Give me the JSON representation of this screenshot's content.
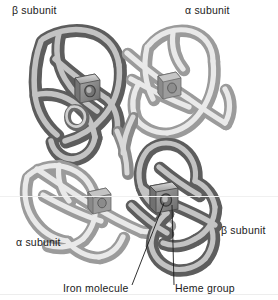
{
  "figure": {
    "background_color": "#ffffff",
    "subunit_colors": {
      "alpha": "#c9c9c9",
      "beta": "#8d8d8d",
      "heme": "#8a8a8a",
      "leader_line": "#1a1a1a",
      "text": "#1a1a1a"
    },
    "labels": {
      "beta_top": "β subunit",
      "alpha_top": "α subunit",
      "alpha_bottom": "α subunit",
      "beta_right": "β subunit",
      "iron": "Iron molecule",
      "heme": "Heme group"
    },
    "subunits": [
      {
        "id": "beta-1",
        "label": "β subunit",
        "position": "top-left",
        "shade": "dark"
      },
      {
        "id": "alpha-1",
        "label": "α subunit",
        "position": "top-right",
        "shade": "light"
      },
      {
        "id": "alpha-2",
        "label": "α subunit",
        "position": "bottom-left",
        "shade": "light"
      },
      {
        "id": "beta-2",
        "label": "β subunit",
        "position": "bottom-right",
        "shade": "dark"
      }
    ],
    "callouts": [
      {
        "name": "iron-molecule",
        "text": "Iron molecule",
        "target": "heme iron atom of bottom-right subunit"
      },
      {
        "name": "heme-group",
        "text": "Heme group",
        "target": "heme prosthetic group of bottom-right subunit"
      }
    ],
    "heme_groups": 4
  }
}
